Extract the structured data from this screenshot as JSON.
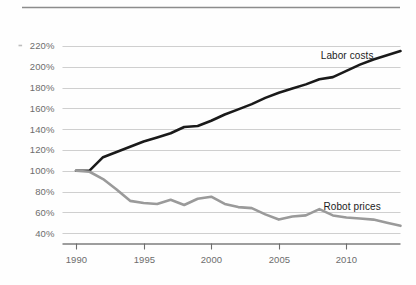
{
  "chart_data": {
    "type": "line",
    "title": "",
    "subtitle": "",
    "xlabel": "",
    "ylabel": "",
    "xlim": [
      1989,
      2014
    ],
    "ylim": [
      30,
      230
    ],
    "grid": true,
    "legend_position": "inline-annotation",
    "yticks": [
      40,
      60,
      80,
      100,
      120,
      140,
      160,
      180,
      200,
      220
    ],
    "ytick_labels": [
      "40%",
      "60%",
      "80%",
      "100%",
      "120%",
      "140%",
      "160%",
      "180%",
      "200%",
      "220%"
    ],
    "xticks": [
      1990,
      1995,
      2000,
      2005,
      2010
    ],
    "xtick_labels": [
      "1990",
      "1995",
      "2000",
      "2005",
      "2010"
    ],
    "x": [
      1990,
      1991,
      1992,
      1993,
      1994,
      1995,
      1996,
      1997,
      1998,
      1999,
      2000,
      2001,
      2002,
      2003,
      2004,
      2005,
      2006,
      2007,
      2008,
      2009,
      2010,
      2011,
      2012,
      2013,
      2014
    ],
    "series": [
      {
        "name": "Labor costs",
        "color": "#1a1a1a",
        "width": 2.6,
        "label_x": 2008.1,
        "label_y": 207,
        "values": [
          100,
          100,
          113,
          118,
          123,
          128,
          132,
          136,
          142,
          143,
          148,
          154,
          159,
          164,
          170,
          175,
          179,
          183,
          188,
          190,
          196,
          202,
          207,
          211,
          215
        ]
      },
      {
        "name": "Robot prices",
        "color": "#9a9a9a",
        "width": 2.6,
        "label_x": 2008.3,
        "label_y": 62,
        "values": [
          100,
          99,
          92,
          82,
          71,
          69,
          68,
          72,
          67,
          73,
          75,
          68,
          65,
          64,
          58,
          53,
          56,
          57,
          63,
          57,
          55,
          54,
          53,
          50,
          47
        ]
      }
    ]
  },
  "annotations": {
    "labor_label": "Labor costs",
    "robot_label": "Robot prices"
  },
  "axes": {
    "y_labels": [
      "220%",
      "200%",
      "180%",
      "160%",
      "140%",
      "120%",
      "100%",
      "80%",
      "60%",
      "40%"
    ],
    "x_labels": [
      "1990",
      "1995",
      "2000",
      "2005",
      "2010"
    ]
  },
  "colors": {
    "labor": "#1a1a1a",
    "robot": "#9a9a9a",
    "grid": "#cfcfcf",
    "axis": "#6d6d6d",
    "rule": "#8c8c8c",
    "background": "#fefefe"
  }
}
